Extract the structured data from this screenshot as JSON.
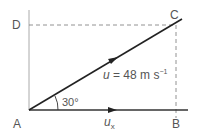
{
  "diagram": {
    "points": {
      "A": "A",
      "B": "B",
      "C": "C",
      "D": "D"
    },
    "angle_label": "30°",
    "velocity_label": {
      "symbol": "u",
      "equals": " = 48 m s",
      "exponent": "−1"
    },
    "component_label": {
      "symbol": "u",
      "subscript": "x"
    },
    "colors": {
      "line": "#333333",
      "dashed": "#777777",
      "axis": "#999999",
      "text": "#555555"
    }
  }
}
